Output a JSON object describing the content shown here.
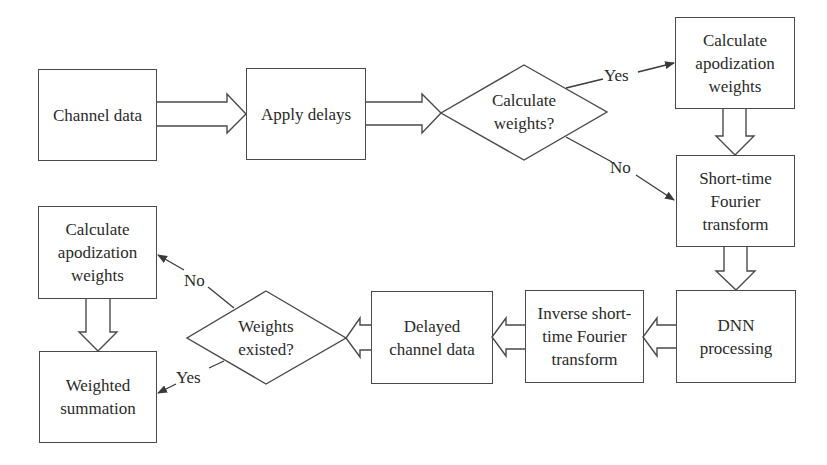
{
  "diagram": {
    "nodes": [
      {
        "id": "channel_data",
        "type": "process",
        "label": "Channel data"
      },
      {
        "id": "apply_delays",
        "type": "process",
        "label": "Apply delays"
      },
      {
        "id": "calc_weights_decision",
        "type": "decision",
        "label": "Calculate\nweights?"
      },
      {
        "id": "calc_apod_1",
        "type": "process",
        "label": "Calculate\napodization\nweights"
      },
      {
        "id": "stft",
        "type": "process",
        "label": "Short-time\nFourier\ntransform"
      },
      {
        "id": "dnn",
        "type": "process",
        "label": "DNN\nprocessing"
      },
      {
        "id": "istft",
        "type": "process",
        "label": "Inverse short-\ntime Fourier\ntransform"
      },
      {
        "id": "delayed_channel",
        "type": "process",
        "label": "Delayed\nchannel data"
      },
      {
        "id": "weights_existed_decision",
        "type": "decision",
        "label": "Weights\nexisted?"
      },
      {
        "id": "calc_apod_2",
        "type": "process",
        "label": "Calculate\napodization\nweights"
      },
      {
        "id": "weighted_sum",
        "type": "process",
        "label": "Weighted\nsummation"
      }
    ],
    "edges": [
      {
        "from": "channel_data",
        "to": "apply_delays",
        "style": "block-arrow"
      },
      {
        "from": "apply_delays",
        "to": "calc_weights_decision",
        "style": "block-arrow"
      },
      {
        "from": "calc_weights_decision",
        "to": "calc_apod_1",
        "style": "line-arrow",
        "label": "Yes"
      },
      {
        "from": "calc_weights_decision",
        "to": "stft",
        "style": "line-arrow",
        "label": "No"
      },
      {
        "from": "calc_apod_1",
        "to": "stft",
        "style": "block-arrow"
      },
      {
        "from": "stft",
        "to": "dnn",
        "style": "block-arrow"
      },
      {
        "from": "dnn",
        "to": "istft",
        "style": "block-arrow"
      },
      {
        "from": "istft",
        "to": "delayed_channel",
        "style": "block-arrow"
      },
      {
        "from": "delayed_channel",
        "to": "weights_existed_decision",
        "style": "block-arrow"
      },
      {
        "from": "weights_existed_decision",
        "to": "calc_apod_2",
        "style": "line-arrow",
        "label": "No"
      },
      {
        "from": "weights_existed_decision",
        "to": "weighted_sum",
        "style": "line-arrow",
        "label": "Yes"
      },
      {
        "from": "calc_apod_2",
        "to": "weighted_sum",
        "style": "block-arrow"
      }
    ],
    "labels": {
      "yes_top": "Yes",
      "no_top": "No",
      "no_bottom": "No",
      "yes_bottom": "Yes"
    },
    "colors": {
      "stroke": "#4a4a4a",
      "text": "#2a2a2a",
      "background": "#ffffff"
    }
  }
}
